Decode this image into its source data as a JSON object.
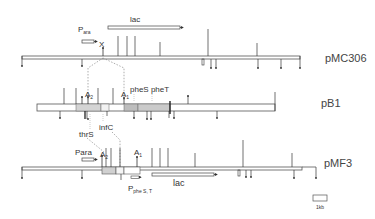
{
  "figure": {
    "type": "plasmid restriction maps",
    "scale_bar_label": "1kb"
  },
  "maps": [
    {
      "name": "pMC306",
      "labels": {
        "promoter": "P",
        "promoter_sub": "ara",
        "gene": "lac",
        "site": "X"
      }
    },
    {
      "name": "pB1",
      "labels": {
        "a2": "A",
        "a2_sub": "2",
        "a1": "A",
        "a1_sub": "1",
        "pheS_pheT": "pheS pheT",
        "thrS": "thrS",
        "infC": "infC"
      }
    },
    {
      "name": "pMF3",
      "labels": {
        "promoter": "Para",
        "a2": "A",
        "a2_sub": "2",
        "a1": "A",
        "a1_sub": "1",
        "pphe": "P",
        "pphe_sub": "phe S, T",
        "gene": "lac"
      }
    }
  ]
}
